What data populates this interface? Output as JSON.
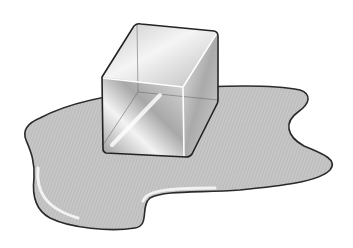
{
  "image": {
    "alt": "Illustration of a melting ice cube sitting in a puddle of water",
    "subject": "ice cube",
    "surrounding": "water puddle"
  },
  "colors": {
    "background": "#ffffff",
    "puddle_fill": "#c4c4c4",
    "puddle_outline": "#2a2a2a",
    "highlight": "#f4f4f4",
    "cube_outline": "#222222",
    "cube_light": "#f2f2f2",
    "cube_mid": "#b8b8b8",
    "cube_dark": "#8a8a8a"
  }
}
